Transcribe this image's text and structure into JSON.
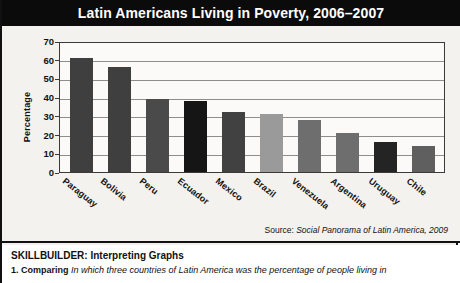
{
  "title": "Latin Americans Living in Poverty, 2006–2007",
  "source": {
    "prefix": "Source: ",
    "title": "Social Panorama of Latin America, 2009"
  },
  "skillbuilder": {
    "heading": "SKILLBUILDER: Interpreting Graphs",
    "question_number": "1.",
    "question_label": "Comparing",
    "question_text": "In which three countries of Latin America was the percentage of people living in"
  },
  "colors": {
    "title_bar_bg": "#0b0b0b",
    "title_text": "#ffffff",
    "panel_bg": "#f4f2ee",
    "plot_bg": "#fbfaf8",
    "gridline": "#8d8d8d",
    "bar_dark": "#3a3a3a",
    "bar_black": "#151515",
    "bar_medium": "#6e6e6e",
    "bar_light": "#9a9a9a"
  },
  "chart_data": {
    "type": "bar",
    "title": "Latin Americans Living in Poverty, 2006–2007",
    "xlabel": "",
    "ylabel": "Percentage",
    "ylim": [
      0,
      70
    ],
    "yticks": [
      70,
      60,
      50,
      40,
      30,
      20,
      10,
      0
    ],
    "grid": true,
    "legend": "none",
    "categories": [
      "Paraguay",
      "Bolivia",
      "Peru",
      "Ecuador",
      "Mexico",
      "Brazil",
      "Venezuela",
      "Argentina",
      "Uruguay",
      "Chile"
    ],
    "values": [
      61,
      56,
      39,
      38,
      32,
      31,
      28,
      21,
      16,
      14
    ],
    "bar_colors": [
      "#3f3f3f",
      "#3f3f3f",
      "#4a4a4a",
      "#151515",
      "#414141",
      "#9a9a9a",
      "#6e6e6e",
      "#6e6e6e",
      "#242424",
      "#5f5f5f"
    ],
    "source": "Social Panorama of Latin America, 2009"
  }
}
